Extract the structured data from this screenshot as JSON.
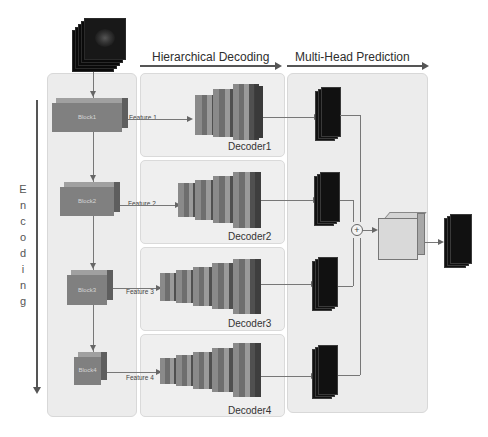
{
  "headers": {
    "decoding": "Hierarchical Decoding",
    "prediction": "Multi-Head Prediction"
  },
  "encoding_label": [
    "E",
    "n",
    "c",
    "o",
    "d",
    "i",
    "n",
    "g"
  ],
  "encoder_blocks": [
    {
      "label": "Block1",
      "feature": "Feature 1"
    },
    {
      "label": "Block2",
      "feature": "Feature 2"
    },
    {
      "label": "Block3",
      "feature": "Feature 3"
    },
    {
      "label": "Block4",
      "feature": "Feature 4"
    }
  ],
  "decoders": [
    {
      "label": "Decoder1"
    },
    {
      "label": "Decoder2"
    },
    {
      "label": "Decoder3"
    },
    {
      "label": "Decoder4"
    }
  ],
  "fusion": {
    "symbol": "+"
  },
  "colors": {
    "panel_bg": "#ececec",
    "block_front": "#7f7f7f",
    "arrow": "#555555",
    "prediction_map": "#111111"
  }
}
